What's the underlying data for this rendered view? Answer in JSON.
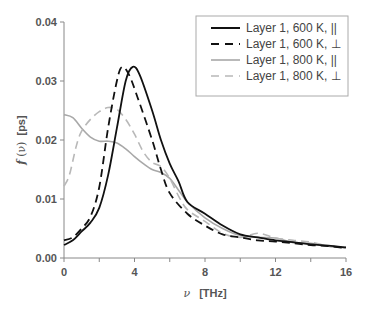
{
  "chart_data": {
    "type": "line",
    "title": "",
    "xlabel": "ν [THz]",
    "ylabel": "f(ν) [ps]",
    "xlim": [
      0,
      16
    ],
    "ylim": [
      0,
      0.04
    ],
    "xticks": [
      "0",
      "4",
      "8",
      "12",
      "16"
    ],
    "yticks": [
      "0.00",
      "0.01",
      "0.02",
      "0.03",
      "0.04"
    ],
    "grid": false,
    "legend_position": "upper right",
    "series": [
      {
        "name": "Layer 1, 600 K, ||",
        "style": "solid",
        "color": "#111111",
        "x": [
          0,
          0.5,
          1,
          1.5,
          2,
          2.5,
          3,
          3.5,
          3.9,
          4.3,
          5,
          5.5,
          6,
          6.5,
          7,
          8,
          9,
          10,
          11,
          12,
          13,
          14,
          15,
          16
        ],
        "y": [
          0.0022,
          0.003,
          0.0045,
          0.006,
          0.0085,
          0.014,
          0.022,
          0.03,
          0.0324,
          0.031,
          0.025,
          0.02,
          0.016,
          0.013,
          0.0095,
          0.0075,
          0.0055,
          0.004,
          0.0035,
          0.003,
          0.0027,
          0.0023,
          0.0021,
          0.0018
        ]
      },
      {
        "name": "Layer 1, 600 K, ⊥",
        "style": "dashed",
        "color": "#111111",
        "x": [
          0,
          0.5,
          1,
          1.5,
          2,
          2.5,
          3,
          3.3,
          3.7,
          4.2,
          5,
          5.5,
          6,
          7,
          8,
          9,
          10,
          11,
          12,
          13,
          14,
          15,
          16
        ],
        "y": [
          0.003,
          0.0035,
          0.005,
          0.007,
          0.012,
          0.022,
          0.03,
          0.0324,
          0.031,
          0.027,
          0.02,
          0.015,
          0.011,
          0.0075,
          0.0055,
          0.004,
          0.0035,
          0.003,
          0.0028,
          0.0025,
          0.0022,
          0.002,
          0.0017
        ]
      },
      {
        "name": "Layer 1, 800 K, ||",
        "style": "solid",
        "color": "#a8a8a8",
        "x": [
          0,
          0.5,
          1,
          1.5,
          2,
          2.5,
          3,
          3.5,
          4,
          4.5,
          5,
          5.5,
          6,
          6.5,
          7,
          8,
          9,
          10,
          11,
          12,
          13,
          14,
          15,
          16
        ],
        "y": [
          0.0243,
          0.0238,
          0.022,
          0.0205,
          0.0198,
          0.0198,
          0.0195,
          0.0185,
          0.0172,
          0.016,
          0.015,
          0.0145,
          0.0135,
          0.0115,
          0.0095,
          0.0068,
          0.005,
          0.0038,
          0.0035,
          0.0034,
          0.0026,
          0.0025,
          0.002,
          0.0018
        ]
      },
      {
        "name": "Layer 1, 800 K, ⊥",
        "style": "dashed",
        "color": "#b8b8b8",
        "x": [
          0,
          0.3,
          0.7,
          1,
          1.5,
          2,
          2.5,
          3,
          3.5,
          4,
          4.5,
          5,
          5.5,
          6,
          6.5,
          7,
          8,
          9,
          10,
          11,
          12,
          13,
          14,
          15,
          16
        ],
        "y": [
          0.0122,
          0.014,
          0.019,
          0.0215,
          0.0235,
          0.0248,
          0.0255,
          0.0252,
          0.0235,
          0.021,
          0.018,
          0.0162,
          0.0155,
          0.0135,
          0.0105,
          0.0082,
          0.0062,
          0.0042,
          0.0035,
          0.0042,
          0.0034,
          0.003,
          0.0027,
          0.002,
          0.0017
        ]
      }
    ]
  },
  "legend": {
    "items": [
      {
        "label": "Layer 1, 600 K, ||"
      },
      {
        "label": "Layer 1, 600 K, ⊥"
      },
      {
        "label": "Layer 1, 800 K, ||"
      },
      {
        "label": "Layer 1, 800 K, ⊥"
      }
    ]
  },
  "axes": {
    "xlabel_symbol": "ν",
    "xlabel_unit": "[THz]",
    "ylabel_f": "f",
    "ylabel_arg": "(ν)",
    "ylabel_unit": "[ps]"
  }
}
